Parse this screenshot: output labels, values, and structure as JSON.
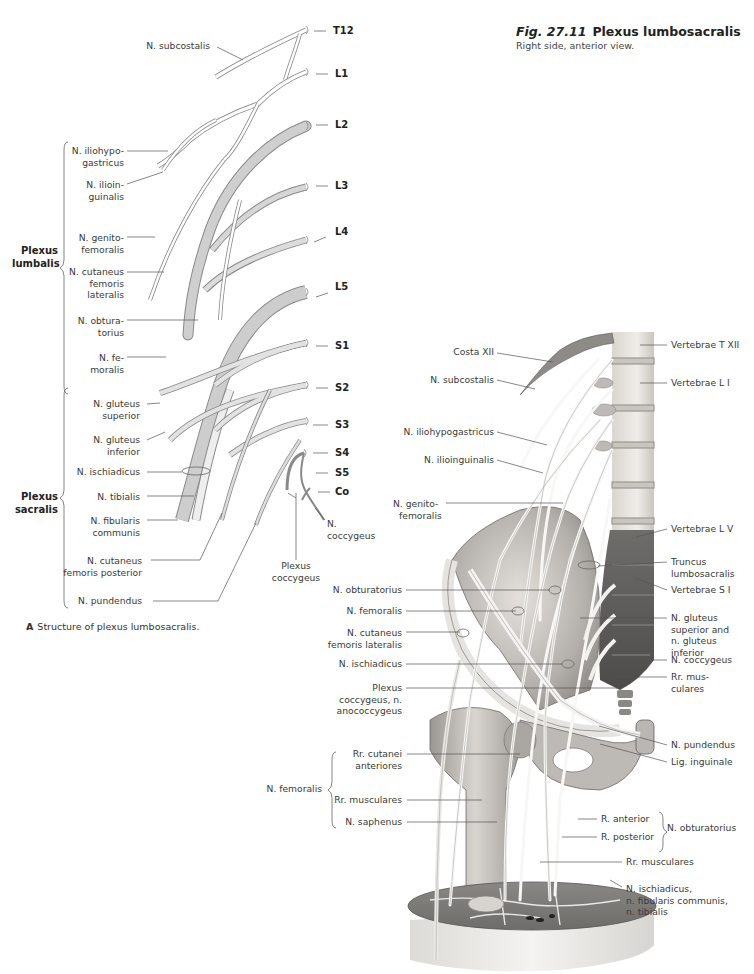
{
  "figure": {
    "number": "Fig. 27.11",
    "title": "Plexus lumbosacralis",
    "subtitle": "Right side, anterior view."
  },
  "panel_a": {
    "caption_letter": "A",
    "caption_text": "Structure of plexus lumbosacralis.",
    "segments": [
      "T12",
      "L1",
      "L2",
      "L3",
      "L4",
      "L5",
      "S1",
      "S2",
      "S3",
      "S4",
      "S5",
      "Co"
    ],
    "groups": {
      "lumbalis": [
        "Plexus",
        "lumbalis"
      ],
      "sacralis": [
        "Plexus",
        "sacralis"
      ]
    },
    "labels": {
      "subcostalis": "N. subcostalis",
      "iliohypogastricus": [
        "N. iliohypo-",
        "gastricus"
      ],
      "ilioinguinalis": [
        "N. ilioin-",
        "guinalis"
      ],
      "genitofemoralis": [
        "N. genito-",
        "femoralis"
      ],
      "cutaneus_fem_lat": [
        "N. cutaneus",
        "femoris",
        "lateralis"
      ],
      "obturatorius": [
        "N. obtura-",
        "torius"
      ],
      "femoralis": [
        "N. fe-",
        "moralis"
      ],
      "gluteus_sup": [
        "N. gluteus",
        "superior"
      ],
      "gluteus_inf": [
        "N. gluteus",
        "inferior"
      ],
      "ischiadicus": "N. ischiadicus",
      "tibialis": "N. tibialis",
      "fibularis": [
        "N. fibularis",
        "communis"
      ],
      "cutaneus_fem_post": [
        "N. cutaneus",
        "femoris posterior"
      ],
      "pundendus": "N. pundendus",
      "coccygeus": [
        "N.",
        "coccygeus"
      ],
      "plexus_coccygeus": [
        "Plexus",
        "coccygeus"
      ]
    }
  },
  "panel_b": {
    "left_labels": {
      "costa": "Costa XII",
      "subcostalis": "N. subcostalis",
      "iliohypogastricus": "N. iliohypogastricus",
      "ilioinguinalis": "N. ilioinguinalis",
      "genitofemoralis": [
        "N. genito-",
        "femoralis"
      ],
      "obturatorius": "N. obturatorius",
      "femoralis": "N. femoralis",
      "cutaneus_fem_lat": [
        "N. cutaneus",
        "femoris lateralis"
      ],
      "ischiadicus": "N. ischiadicus",
      "plexus_coccygeus": [
        "Plexus",
        "coccygeus, n.",
        "anococcygeus"
      ],
      "femoralis_group": "N. femoralis",
      "rr_cutanei": [
        "Rr. cutanei",
        "anteriores"
      ],
      "rr_musculares": "Rr. musculares",
      "saphenus": "N. saphenus"
    },
    "right_labels": {
      "vert_txii": "Vertebrae T XII",
      "vert_li": "Vertebrae L I",
      "vert_lv": "Vertebrae L V",
      "truncus": [
        "Truncus",
        "lumbosacralis"
      ],
      "vert_si": "Vertebrae S I",
      "gluteus": [
        "N. gluteus",
        "superior and",
        "n. gluteus",
        "inferior"
      ],
      "coccygeus": "N. coccygeus",
      "rr_musc": [
        "Rr. mus-",
        "culares"
      ],
      "pundendus": "N. pundendus",
      "lig_inguinale": "Lig. inguinale",
      "r_anterior": "R. anterior",
      "r_posterior": "R. posterior",
      "obturatorius_group": "N. obturatorius",
      "rr_musculares_low": "Rr. musculares",
      "ischiadicus_combo": [
        "N. ischiadicus,",
        "n. fibularis communis,",
        "n. tibialis"
      ]
    }
  },
  "colors": {
    "nerve_fill": "#ffffff",
    "nerve_shaded": "#c9c9c9",
    "nerve_outline": "#7a7a7a",
    "bone_light": "#e8e6e2",
    "bone_mid": "#bdbab5",
    "bone_dark": "#6e6c69",
    "leader": "#555555"
  }
}
